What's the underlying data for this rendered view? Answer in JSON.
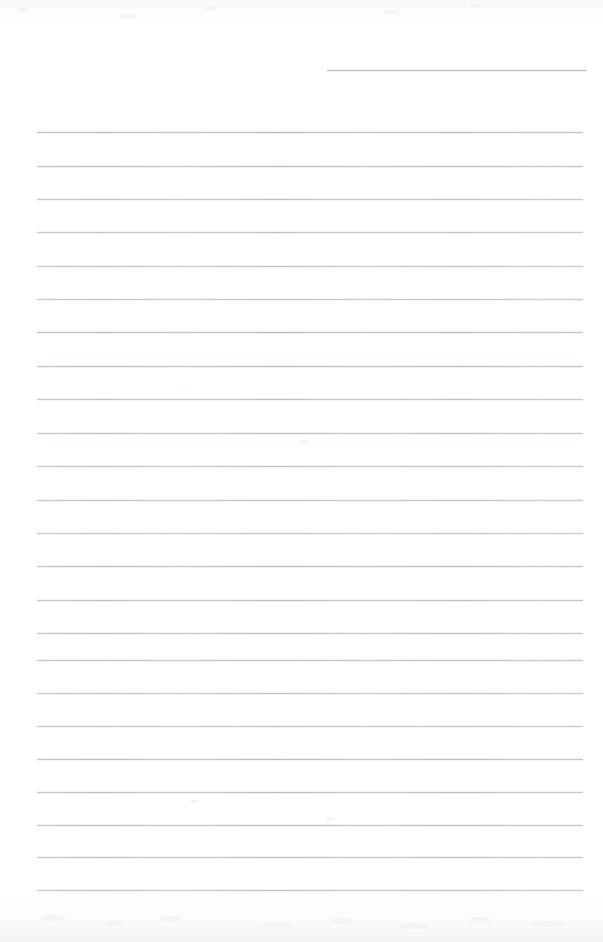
{
  "document": {
    "type": "scanned-lined-notebook-page",
    "title": "Blank ruled notebook page",
    "page_width": 603,
    "page_height": 942,
    "paper_color": "#ffffff",
    "rule_color": "#b9bdc2",
    "handwritten_text": "",
    "printed_text": "",
    "is_blank": "true"
  },
  "ruling": {
    "left_margin_x": 37,
    "right_margin_x": 583,
    "line_spacing": 33.2,
    "full_line_count": 24,
    "partial_line_count": 1,
    "partial_line_start_x": 327,
    "first_line_y": 132,
    "last_line_y": 890,
    "lines": [
      {
        "y": 70,
        "x1": 327,
        "x2": 586,
        "partial": true
      },
      {
        "y": 132,
        "x1": 37,
        "x2": 583,
        "partial": false
      },
      {
        "y": 166,
        "x1": 37,
        "x2": 583,
        "partial": false
      },
      {
        "y": 199,
        "x1": 37,
        "x2": 583,
        "partial": false
      },
      {
        "y": 232,
        "x1": 37,
        "x2": 583,
        "partial": false
      },
      {
        "y": 266,
        "x1": 37,
        "x2": 583,
        "partial": false
      },
      {
        "y": 299,
        "x1": 37,
        "x2": 583,
        "partial": false
      },
      {
        "y": 332,
        "x1": 37,
        "x2": 583,
        "partial": false
      },
      {
        "y": 366,
        "x1": 37,
        "x2": 583,
        "partial": false
      },
      {
        "y": 399,
        "x1": 37,
        "x2": 583,
        "partial": false
      },
      {
        "y": 433,
        "x1": 37,
        "x2": 583,
        "partial": false
      },
      {
        "y": 466,
        "x1": 37,
        "x2": 583,
        "partial": false
      },
      {
        "y": 500,
        "x1": 37,
        "x2": 583,
        "partial": false
      },
      {
        "y": 533,
        "x1": 37,
        "x2": 583,
        "partial": false
      },
      {
        "y": 566,
        "x1": 37,
        "x2": 583,
        "partial": false
      },
      {
        "y": 600,
        "x1": 37,
        "x2": 583,
        "partial": false
      },
      {
        "y": 633,
        "x1": 37,
        "x2": 583,
        "partial": false
      },
      {
        "y": 660,
        "x1": 37,
        "x2": 583,
        "partial": false
      },
      {
        "y": 693,
        "x1": 37,
        "x2": 583,
        "partial": false
      },
      {
        "y": 726,
        "x1": 37,
        "x2": 583,
        "partial": false
      },
      {
        "y": 759,
        "x1": 37,
        "x2": 583,
        "partial": false
      },
      {
        "y": 792,
        "x1": 37,
        "x2": 583,
        "partial": false
      },
      {
        "y": 825,
        "x1": 37,
        "x2": 583,
        "partial": false
      },
      {
        "y": 857,
        "x1": 37,
        "x2": 583,
        "partial": false
      },
      {
        "y": 890,
        "x1": 37,
        "x2": 583,
        "partial": false
      }
    ]
  },
  "artifacts": {
    "top_shadow": "true",
    "bottom_shadow": "true",
    "speckles": [
      {
        "x": 18,
        "y": 8,
        "w": 10,
        "h": 4
      },
      {
        "x": 120,
        "y": 14,
        "w": 16,
        "h": 5
      },
      {
        "x": 205,
        "y": 6,
        "w": 12,
        "h": 4
      },
      {
        "x": 385,
        "y": 10,
        "w": 14,
        "h": 4
      },
      {
        "x": 470,
        "y": 4,
        "w": 10,
        "h": 4
      },
      {
        "x": 40,
        "y": 915,
        "w": 26,
        "h": 6
      },
      {
        "x": 105,
        "y": 920,
        "w": 18,
        "h": 6
      },
      {
        "x": 160,
        "y": 916,
        "w": 22,
        "h": 6
      },
      {
        "x": 262,
        "y": 922,
        "w": 30,
        "h": 6
      },
      {
        "x": 330,
        "y": 918,
        "w": 24,
        "h": 6
      },
      {
        "x": 400,
        "y": 923,
        "w": 28,
        "h": 6
      },
      {
        "x": 470,
        "y": 917,
        "w": 20,
        "h": 6
      },
      {
        "x": 530,
        "y": 921,
        "w": 34,
        "h": 6
      },
      {
        "x": 190,
        "y": 800,
        "w": 9,
        "h": 3
      },
      {
        "x": 300,
        "y": 440,
        "w": 7,
        "h": 3
      },
      {
        "x": 326,
        "y": 817,
        "w": 8,
        "h": 3
      }
    ]
  }
}
